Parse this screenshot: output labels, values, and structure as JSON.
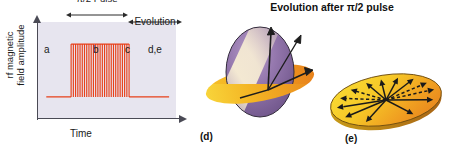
{
  "figure": {
    "title": "Evolution after π/2 pulse"
  },
  "pulse_chart": {
    "y_axis_label": "rf magnetic\nfield amplitude",
    "x_axis_label": "Time",
    "region_labels": {
      "a": "a",
      "b": "b",
      "c": "c",
      "de": "d,e"
    },
    "annotations": {
      "pulse": "π/2 Pulse",
      "evolution": "Evolution"
    },
    "colors": {
      "plot_background": "#e7e5ef",
      "axis": "#4a4a55",
      "signal": "#e8401a",
      "signal_light": "#f0704a"
    }
  },
  "panels": {
    "d": {
      "tag": "(d)",
      "colors": {
        "sphere_purple": "#8a6fa8",
        "sphere_highlight": "#f3e6c4",
        "disk_yellow": "#f2b21e",
        "disk_orange": "#ec8a1e",
        "outline": "#2b2b2b"
      }
    },
    "e": {
      "tag": "(e)",
      "colors": {
        "disk_yellow": "#f5d02a",
        "disk_orange": "#ee8f22",
        "outline": "#2b2b2b"
      }
    }
  },
  "chart_data": {
    "type": "line",
    "xlabel": "Time",
    "ylabel": "rf magnetic field amplitude",
    "series": [
      {
        "name": "rf pulse envelope",
        "description": "Flat baseline, then a burst of ~26 full-amplitude oscillation cycles (the π/2 pulse), then flat baseline again",
        "segments": [
          {
            "region": "a",
            "x_start": 0.06,
            "x_end": 0.24,
            "amplitude": 0.0,
            "baseline": 0.22
          },
          {
            "region": "b",
            "x_start": 0.24,
            "x_end": 0.66,
            "amplitude": 0.55,
            "baseline": 0.22,
            "cycles": 26
          },
          {
            "region": "d,e",
            "x_start": 0.66,
            "x_end": 0.95,
            "amplitude": 0.0,
            "baseline": 0.22
          }
        ]
      }
    ],
    "annotations": [
      {
        "label": "π/2 Pulse",
        "x_start": 0.24,
        "x_end": 0.66
      },
      {
        "label": "Evolution",
        "x_start": 0.66,
        "x_end": 1.0
      },
      {
        "label": "a",
        "x": 0.1
      },
      {
        "label": "b",
        "x": 0.42
      },
      {
        "label": "c",
        "x": 0.65
      },
      {
        "label": "d,e",
        "x": 0.82
      }
    ],
    "grid": false,
    "legend": "none"
  }
}
